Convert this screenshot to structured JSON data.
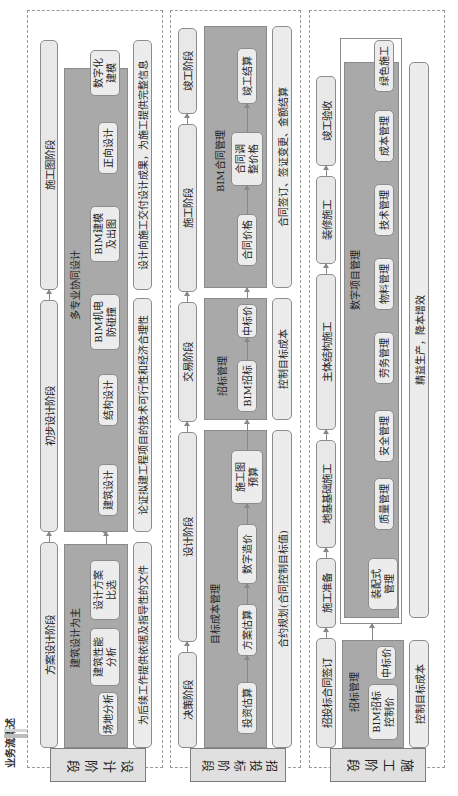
{
  "header": {
    "title": "业务流概述"
  },
  "rows": [
    {
      "stage_label": "设计阶段",
      "phases": [
        "方案设计阶段",
        "初步设计阶段",
        "施工图阶段"
      ],
      "groups": [
        {
          "label": "建筑设计为主",
          "items": [
            "场地分析",
            "建筑性能\n分析",
            "设计方案\n比选"
          ]
        },
        {
          "label": "多专业协同设计",
          "items": [
            "建筑设计",
            "结构设计",
            "BIM机电\n防碰撞",
            "BIM建模\n及出图",
            "正向设计",
            "数字化\n建模"
          ]
        }
      ],
      "notes": [
        "为后续工作提供依据及指导性的文件",
        "论证拟建工程项目的技术可行性和经济合理性",
        "设计向施工交付设计成果，为施工提供完整信息"
      ]
    },
    {
      "stage_label": "招投标阶段",
      "phases": [
        "决策阶段",
        "设计阶段",
        "交易阶段",
        "施工阶段",
        "竣工阶段"
      ],
      "groups": [
        {
          "label": "目标成本管理",
          "items": [
            "投资估算",
            "方案估算",
            "数字造价",
            "施工图\n预算"
          ]
        },
        {
          "label": "招标管理",
          "items": [
            "BIM招标",
            "中标价"
          ]
        },
        {
          "label": "BIM合同管理",
          "items": [
            "合同价格",
            "合同调\n整价格",
            "竣工结算"
          ]
        }
      ],
      "notes": [
        "合约规划(合同控制目标值)",
        "控制目标成本",
        "合同签订、签证变更、金额结算"
      ]
    },
    {
      "stage_label": "施工阶段",
      "phases": [
        "招投标合同签订",
        "施工准备",
        "地基基础施工",
        "主体结构施工",
        "装修施工",
        "竣工验收"
      ],
      "groups": [
        {
          "label": "招标管理",
          "items": [
            "BIM招标\n控制价",
            "中标价"
          ]
        },
        {
          "label": "数字项目管理",
          "items": [
            "装配式\n管理",
            "质量管理",
            "安全管理",
            "劳务管理",
            "物料管理",
            "技术管理",
            "成本管理",
            "绿色施工"
          ]
        }
      ],
      "notes": [
        "控制目标成本",
        "精益生产，降本增效"
      ]
    }
  ],
  "colors": {
    "box_fill": "#e8e8e8",
    "group_fill": "#a9a9a9",
    "border": "#8c8c8c",
    "dashed": "#9a9a9a"
  }
}
